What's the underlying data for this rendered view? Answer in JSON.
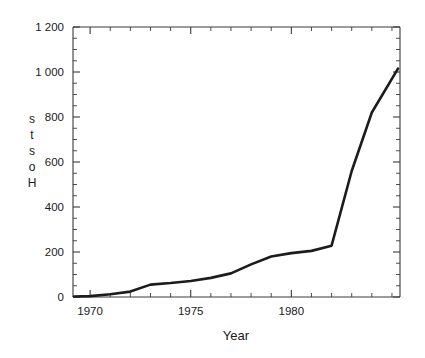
{
  "chart_data": {
    "type": "line",
    "title": "",
    "subtitle": "",
    "xlabel": "Year",
    "ylabel": "Hosts",
    "ylabel_chars": [
      "s",
      "t",
      "s",
      "o",
      "H"
    ],
    "xlim": [
      1969.15,
      1985.4
    ],
    "ylim": [
      0,
      1200
    ],
    "grid": false,
    "legend": null,
    "x_ticks_major": [
      1970,
      1975,
      1980
    ],
    "x_tick_labels": [
      "1970",
      "1975",
      "1980"
    ],
    "x_ticks_minor": [
      1971,
      1972,
      1973,
      1974,
      1976,
      1977,
      1978,
      1979,
      1981,
      1982,
      1983,
      1984,
      1985
    ],
    "y_ticks_major": [
      0,
      200,
      400,
      600,
      800,
      1000,
      1200
    ],
    "y_tick_labels": [
      "0",
      "200",
      "400",
      "600",
      "800",
      "1 000",
      "1 200"
    ],
    "y_ticks_minor": [
      50,
      100,
      150,
      250,
      300,
      350,
      450,
      500,
      550,
      650,
      700,
      750,
      850,
      900,
      950,
      1050,
      1100,
      1150
    ],
    "line_color": "#1c1c1c",
    "axis_color": "#3a3a3a",
    "background_color": "#ffffff",
    "series": [
      {
        "name": "Hosts",
        "x": [
          1969.2,
          1970.0,
          1971.0,
          1972.0,
          1973.0,
          1974.0,
          1975.0,
          1976.0,
          1977.0,
          1978.0,
          1979.0,
          1980.0,
          1981.0,
          1982.0,
          1983.0,
          1984.0,
          1985.3
        ],
        "values": [
          2,
          4,
          12,
          24,
          55,
          62,
          71,
          85,
          105,
          145,
          180,
          195,
          205,
          228,
          560,
          820,
          1015
        ]
      }
    ]
  },
  "figure": {
    "width": 425,
    "height": 358
  }
}
